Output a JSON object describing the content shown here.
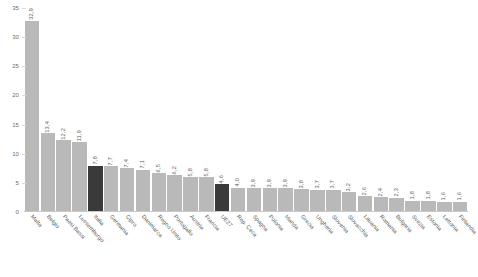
{
  "chart_data": {
    "type": "bar",
    "title": "",
    "subtitle": "",
    "xlabel": "",
    "ylabel": "",
    "ylim": [
      0,
      35
    ],
    "yticks": [
      0,
      5,
      10,
      15,
      20,
      25,
      30,
      35
    ],
    "ytick_labels": [
      "0",
      "5",
      "10",
      "15",
      "20",
      "25",
      "30",
      "35"
    ],
    "grid": true,
    "legend": "none",
    "categories": [
      "Malta",
      "Belgio",
      "Paesi Bassi",
      "Lussemburgo",
      "Italia",
      "Germania",
      "Cipro",
      "Danimarca",
      "Regno Unito",
      "Portogallo",
      "Austria",
      "Francia",
      "UE27",
      "Rep. Ceca",
      "Spagna",
      "Polonia",
      "Irlanda",
      "Grecia",
      "Ungheria",
      "Slovenia",
      "Slovacchia",
      "Lituania",
      "Romania",
      "Bulgaria",
      "Svezia",
      "Estonia",
      "Lettonia",
      "Finlandia"
    ],
    "values": [
      32.9,
      13.4,
      12.2,
      11.9,
      7.8,
      7.7,
      7.4,
      7.1,
      6.5,
      6.2,
      5.8,
      5.8,
      4.6,
      4.0,
      3.9,
      3.9,
      3.9,
      3.8,
      3.7,
      3.7,
      3.2,
      2.6,
      2.4,
      2.3,
      1.8,
      1.8,
      1.6,
      1.6
    ],
    "value_labels": [
      "32,9",
      "13,4",
      "12,2",
      "11,9",
      "7,8",
      "7,7",
      "7,4",
      "7,1",
      "6,5",
      "6,2",
      "5,8",
      "5,8",
      "4,6",
      "4,0",
      "3,9",
      "3,9",
      "3,9",
      "3,8",
      "3,7",
      "3,7",
      "3,2",
      "2,6",
      "2,4",
      "2,3",
      "1,8",
      "1,8",
      "1,6",
      "1,6"
    ],
    "highlighted": [
      "Italia",
      "UE27"
    ],
    "colors": {
      "bar_default": "#b9b9b9",
      "bar_highlight": "#3a3a3a",
      "axis": "#c9c9c9",
      "grid": "#d9d9d9",
      "text": "#5b5b5b"
    }
  }
}
